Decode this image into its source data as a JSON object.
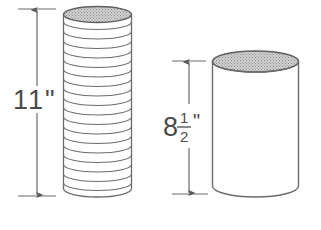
{
  "figure": {
    "background_color": "#ffffff",
    "line_color": "#6b6b6b",
    "label_color": "#4a4a4a",
    "shade_color": "#b8b8b8"
  },
  "left_cylinder": {
    "name": "stack-of-disks-cylinder",
    "dimension_label": "11\"",
    "dimension_value": "11",
    "dimension_unit": "\"",
    "ring_count": 19,
    "top_shaded": true
  },
  "right_cylinder": {
    "name": "smooth-cylinder",
    "dimension_label": "8 1/2\"",
    "whole_number": "8",
    "fraction_numerator": "1",
    "fraction_denominator": "2",
    "dimension_unit": "\"",
    "top_shaded": true
  }
}
